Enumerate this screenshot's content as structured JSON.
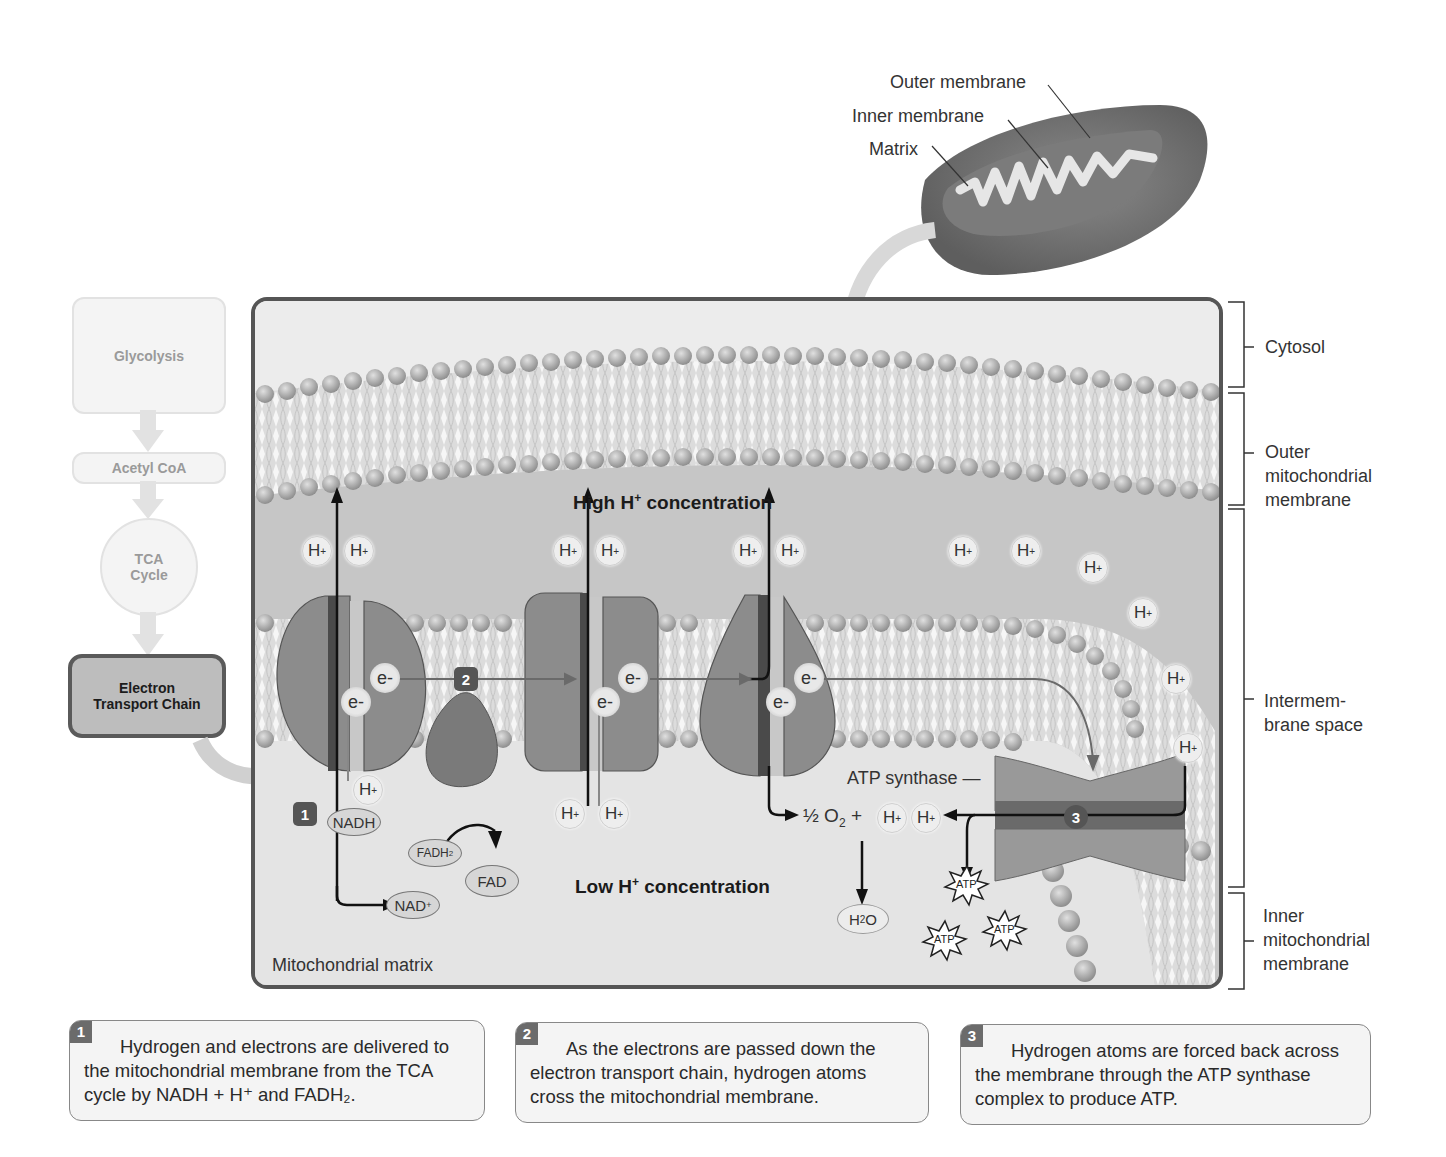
{
  "mitochondrion_inset": {
    "labels": [
      "Outer membrane",
      "Inner membrane",
      "Matrix"
    ]
  },
  "flowchart": {
    "steps": [
      "Glycolysis",
      "Acetyl CoA",
      "TCA Cycle",
      "Electron Transport Chain"
    ],
    "tca_line1": "TCA",
    "tca_line2": "Cycle",
    "etc_line1": "Electron",
    "etc_line2": "Transport Chain"
  },
  "main_diagram": {
    "high_conc": {
      "prefix": "High H",
      "sup": "+",
      "suffix": " concentration"
    },
    "low_conc": {
      "prefix": "Low H",
      "sup": "+",
      "suffix": " concentration"
    },
    "matrix_label": "Mitochondrial matrix",
    "atp_synthase_label": "ATP synthase —",
    "proton": {
      "base": "H",
      "sup": "+"
    },
    "electron": "e-",
    "molecules": {
      "nadh": "NADH",
      "nad": "NAD",
      "nad_sup": "+",
      "fadh2": "FADH",
      "fadh2_sub": "2",
      "fad": "FAD",
      "water_h": "H",
      "water_sub": "2",
      "water_o": "O",
      "oxygen_half": "½ O",
      "oxygen_sub": "2",
      "plus": "+",
      "atp": "ATP"
    },
    "step_badges": [
      "1",
      "2",
      "3"
    ]
  },
  "region_brackets": [
    {
      "label_lines": [
        "Cytosol"
      ]
    },
    {
      "label_lines": [
        "Outer",
        "mitochondrial",
        "membrane"
      ]
    },
    {
      "label_lines": [
        "Intermem-",
        "brane space"
      ]
    },
    {
      "label_lines": [
        "Inner",
        "mitochondrial",
        "membrane"
      ]
    }
  ],
  "captions": [
    {
      "num": "1",
      "text": "Hydrogen and electrons are delivered to the mitochondrial membrane from the TCA cycle by NADH + H⁺ and FADH₂."
    },
    {
      "num": "2",
      "text": "As the electrons are passed down the electron transport chain, hydrogen atoms cross the mitochondrial membrane."
    },
    {
      "num": "3",
      "text": "Hydrogen atoms are forced back across the membrane through the ATP synthase complex to produce ATP."
    }
  ],
  "colors": {
    "protein": "#8a8a8a",
    "membrane_head": "#a8a8a8",
    "intermembrane": "#c4c4c4",
    "matrix": "#e3e3e3",
    "frame": "#555555"
  }
}
